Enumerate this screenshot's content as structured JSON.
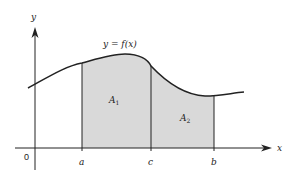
{
  "diagram": {
    "curve_label": "y = f(x)",
    "axes": {
      "x_label": "x",
      "y_label": "y",
      "origin_label": "0"
    },
    "ticks": [
      {
        "label": "a",
        "x": 82
      },
      {
        "label": "c",
        "x": 151
      },
      {
        "label": "b",
        "x": 214
      }
    ],
    "regions": [
      {
        "label": "A",
        "subscript": "1",
        "from": "a",
        "to": "c"
      },
      {
        "label": "A",
        "subscript": "2",
        "from": "c",
        "to": "b"
      }
    ],
    "colors": {
      "fill": "#d9d9d9",
      "stroke": "#222222",
      "background": "#ffffff"
    }
  }
}
